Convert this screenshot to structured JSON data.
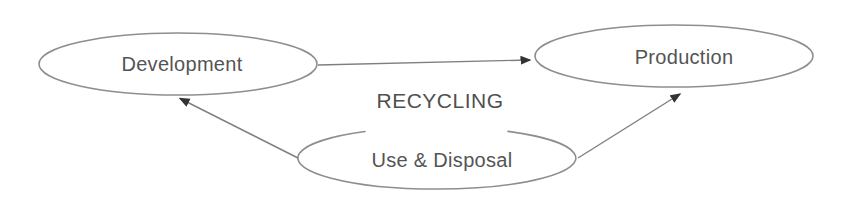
{
  "diagram": {
    "center_label": "RECYCLING",
    "nodes": [
      {
        "id": "development",
        "label": "Development"
      },
      {
        "id": "production",
        "label": "Production"
      },
      {
        "id": "use-disposal",
        "label": "Use & Disposal"
      }
    ],
    "edges": [
      {
        "from": "Development",
        "to": "Production"
      },
      {
        "from": "Use & Disposal",
        "to": "Development"
      },
      {
        "from": "Use & Disposal",
        "to": "Production"
      }
    ],
    "colors": {
      "background": "#ffffff",
      "node_stroke": "#8e8e8e",
      "edge_stroke": "#7f7f7f",
      "arrowhead_fill": "#333333",
      "label_text": "#545454"
    }
  }
}
